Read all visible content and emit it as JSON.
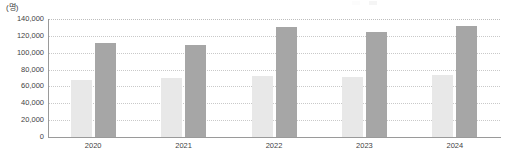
{
  "chart_data": {
    "type": "bar",
    "title": "",
    "subtitle": "",
    "unit_label": "(명)",
    "xlabel": "",
    "ylabel": "",
    "categories": [
      "2020",
      "2021",
      "2022",
      "2023",
      "2024"
    ],
    "series": [
      {
        "name": "series-1",
        "color": "#e8e8e8",
        "values": [
          68000,
          70000,
          72000,
          71000,
          74000
        ]
      },
      {
        "name": "series-2",
        "color": "#a6a6a6",
        "values": [
          112000,
          109000,
          131000,
          125000,
          132000
        ]
      }
    ],
    "ylim": [
      0,
      140000
    ],
    "yticks": [
      0,
      20000,
      40000,
      60000,
      80000,
      100000,
      120000,
      140000
    ],
    "ytick_labels": [
      "0",
      "20,000",
      "40,000",
      "60,000",
      "80,000",
      "100,000",
      "120,000",
      "140,000"
    ],
    "grid": true,
    "grid_axis": "y",
    "legend_position": "top-right",
    "legend_visible": false
  },
  "axis": {
    "unit": "(명)"
  },
  "legend": {
    "items": [
      {
        "label": "",
        "color": "#e8e8e8"
      },
      {
        "label": "",
        "color": "#a6a6a6"
      }
    ]
  }
}
